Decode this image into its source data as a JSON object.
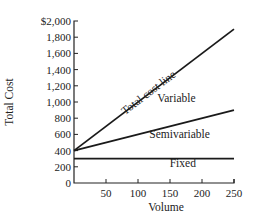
{
  "chart_data": {
    "type": "line",
    "title": "",
    "xlabel": "Volume",
    "ylabel": "Total Cost",
    "xlim": [
      0,
      250
    ],
    "ylim": [
      0,
      2000
    ],
    "x_ticks": [
      50,
      100,
      150,
      200,
      250
    ],
    "x_tick_labels": [
      "50",
      "100",
      "150",
      "200",
      "250"
    ],
    "y_ticks": [
      0,
      200,
      400,
      600,
      800,
      1000,
      1200,
      1400,
      1600,
      1800,
      2000
    ],
    "y_tick_labels": [
      "0",
      "200",
      "400",
      "600",
      "800",
      "1,000",
      "1,200",
      "1,400",
      "1,600",
      "1,800",
      "$2,000"
    ],
    "grid": false,
    "legend": "none",
    "series": [
      {
        "name": "Total cost line",
        "x": [
          0,
          250
        ],
        "values": [
          400,
          1900
        ]
      },
      {
        "name": "Semivariable",
        "x": [
          0,
          250
        ],
        "values": [
          400,
          900
        ]
      },
      {
        "name": "Fixed",
        "x": [
          0,
          250
        ],
        "values": [
          300,
          300
        ]
      }
    ],
    "annotations": [
      {
        "text": "Total cost line",
        "x": 120,
        "y": 1080,
        "rotate_along": "Total cost line"
      },
      {
        "text": "Variable",
        "x": 160,
        "y": 1000
      },
      {
        "text": "Semivariable",
        "x": 165,
        "y": 550
      },
      {
        "text": "Fixed",
        "x": 170,
        "y": 200
      }
    ]
  }
}
